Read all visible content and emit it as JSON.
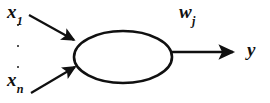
{
  "figure": {
    "background_color": "#ffffff",
    "stroke_color": "#101010",
    "labels": {
      "input_first_base": "x",
      "input_first_sub": "1",
      "input_last_base": "x",
      "input_last_sub": "n",
      "weight_base": "w",
      "weight_sub": "j",
      "output": "y"
    },
    "ellipsis": {
      "name": "vertical-ellipsis",
      "dot_count": 3
    },
    "geometry": {
      "ellipse_cx": 123,
      "ellipse_cy": 57,
      "ellipse_rx": 49,
      "ellipse_ry": 26,
      "input_top_from": [
        29,
        15
      ],
      "input_top_to": [
        76,
        41
      ],
      "input_bottom_from": [
        31,
        93
      ],
      "input_bottom_to": [
        77,
        66
      ],
      "output_from": [
        172,
        52
      ],
      "output_to": [
        236,
        52
      ]
    }
  }
}
